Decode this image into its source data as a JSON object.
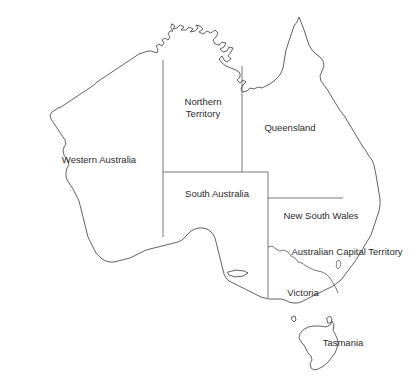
{
  "map": {
    "title": "Map of Australia with states and territories",
    "background_color": "#ffffff",
    "coastline_color": "#3a3a3a",
    "border_color": "#555555",
    "label_color": "#2b2b2b",
    "labels": [
      {
        "name": "western-australia",
        "text": "Western Australia",
        "x": 99,
        "y": 160
      },
      {
        "name": "northern-territory-line1",
        "text": "Northern",
        "x": 203,
        "y": 101
      },
      {
        "name": "northern-territory-line2",
        "text": "Territory",
        "x": 203,
        "y": 114
      },
      {
        "name": "queensland",
        "text": "Queensland",
        "x": 290,
        "y": 128
      },
      {
        "name": "south-australia",
        "text": "South Australia",
        "x": 217,
        "y": 194
      },
      {
        "name": "new-south-wales",
        "text": "New South Wales",
        "x": 321,
        "y": 216
      },
      {
        "name": "australian-capital-territory",
        "text": "Australian Capital Territory",
        "x": 347,
        "y": 252
      },
      {
        "name": "victoria",
        "text": "Victoria",
        "x": 303,
        "y": 293
      },
      {
        "name": "tasmania",
        "text": "Tasmania",
        "x": 343,
        "y": 343
      }
    ],
    "regions": [
      "Western Australia",
      "Northern Territory",
      "Queensland",
      "South Australia",
      "New South Wales",
      "Australian Capital Territory",
      "Victoria",
      "Tasmania"
    ]
  }
}
